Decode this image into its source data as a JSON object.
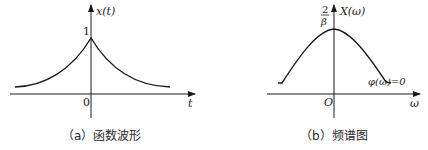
{
  "panel_a": {
    "y_label": "x(t)",
    "x_label": "t",
    "origin_label": "0",
    "peak_label": "1",
    "caption": "（a）函数波形"
  },
  "panel_b": {
    "y_label": "X(ω)",
    "x_label": "ω",
    "origin_label": "O",
    "peak_label_num": "2",
    "peak_label_den": "β",
    "phase_label": "φ(ω)=0",
    "caption": "（b）频谱图"
  },
  "colors": {
    "stroke": "#1a1a1a",
    "background": "#ffffff"
  }
}
